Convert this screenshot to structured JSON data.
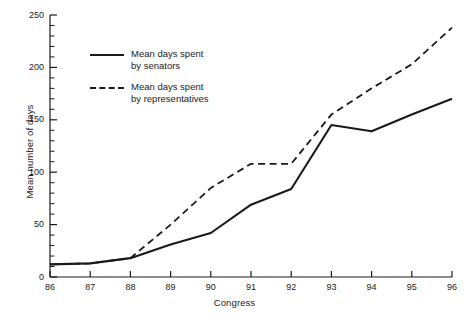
{
  "chart_data": {
    "type": "line",
    "title": "",
    "xlabel": "Congress",
    "ylabel": "Mean number of days",
    "x": [
      86,
      87,
      88,
      89,
      90,
      91,
      92,
      93,
      94,
      95,
      96
    ],
    "categories": [
      "86",
      "87",
      "88",
      "89",
      "90",
      "91",
      "92",
      "93",
      "94",
      "95",
      "96"
    ],
    "xlim": [
      86,
      96
    ],
    "ylim": [
      0,
      250
    ],
    "y_ticks_major": [
      0,
      50,
      100,
      150,
      200,
      250
    ],
    "y_tick_labels": [
      "0",
      "50",
      "100",
      "150",
      "200",
      "250"
    ],
    "y_minor_tick_step": 10,
    "grid": false,
    "legend_position": "upper-left-inside",
    "series": [
      {
        "name": "Mean days spent by senators",
        "style": "solid",
        "color": "#1a1a1a",
        "values": [
          12,
          13,
          18,
          31,
          42,
          69,
          84,
          145,
          139,
          155,
          170
        ]
      },
      {
        "name": "Mean days spent by representatives",
        "style": "dashed",
        "color": "#1a1a1a",
        "values": [
          12,
          13,
          18,
          50,
          85,
          108,
          108,
          155,
          180,
          203,
          238
        ]
      }
    ]
  },
  "axes": {
    "y_title": "Mean number of days",
    "x_title": "Congress"
  },
  "legend": {
    "items": [
      {
        "style": "solid",
        "line1": "Mean days spent",
        "line2": "by senators"
      },
      {
        "style": "dashed",
        "line1": "Mean days spent",
        "line2": "by representatives"
      }
    ]
  },
  "colors": {
    "ink": "#1a1a1a",
    "background": "#ffffff"
  }
}
